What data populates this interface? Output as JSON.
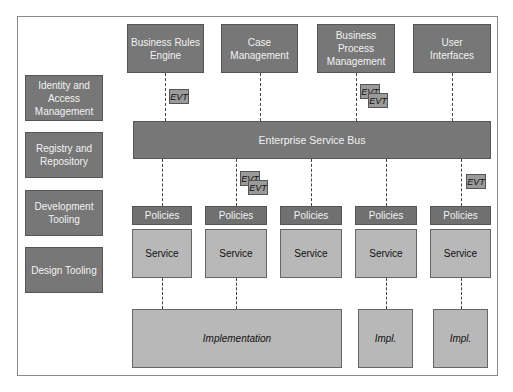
{
  "side_boxes": [
    {
      "label": "Identity and Access Management"
    },
    {
      "label": "Registry and Repository"
    },
    {
      "label": "Development Tooling"
    },
    {
      "label": "Design Tooling"
    }
  ],
  "top_boxes": [
    {
      "label": "Business Rules Engine"
    },
    {
      "label": "Case Management"
    },
    {
      "label": "Business Process Management"
    },
    {
      "label": "User Interfaces"
    }
  ],
  "esb": {
    "label": "Enterprise Service Bus"
  },
  "policies": {
    "label": "Policies"
  },
  "service": {
    "label": "Service"
  },
  "evt": {
    "label": "EVT"
  },
  "implementation": [
    {
      "label": "Implementation"
    },
    {
      "label": "Impl."
    },
    {
      "label": "Impl."
    }
  ],
  "colors": {
    "dark_box": "#777777",
    "light_box": "#b8b8b8",
    "border": "#555555"
  }
}
